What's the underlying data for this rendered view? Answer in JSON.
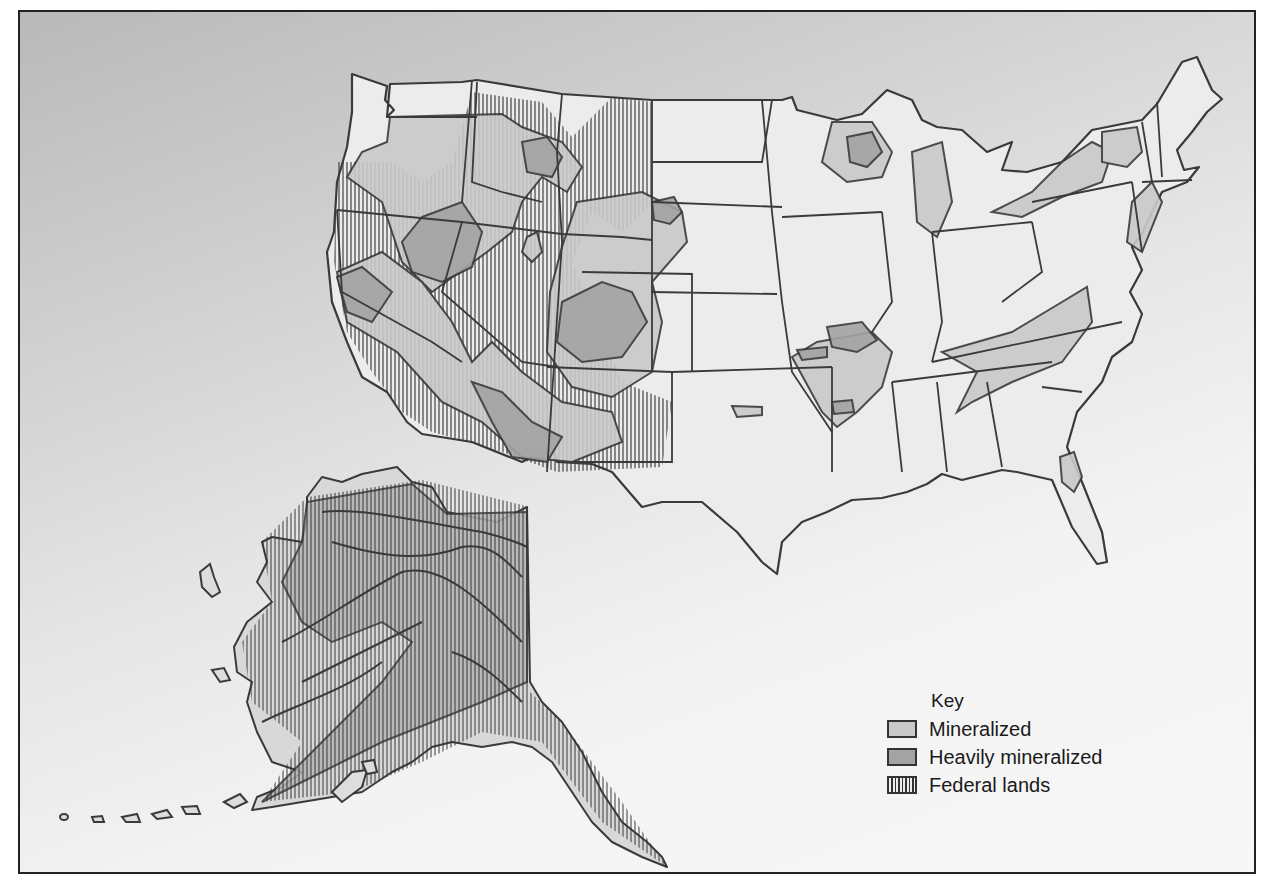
{
  "figure": {
    "type": "map"
  },
  "legend": {
    "title": "Key",
    "items": [
      {
        "label": "Mineralized",
        "pattern": "light-gray-fill",
        "color": "#c9c9c9"
      },
      {
        "label": "Heavily mineralized",
        "pattern": "dark-gray-fill",
        "color": "#a3a3a3"
      },
      {
        "label": "Federal lands",
        "pattern": "vertical-hatch",
        "color": "#333333"
      }
    ]
  },
  "colors": {
    "land": "#ececec",
    "outline": "#3a3a3a",
    "mineralized": "#c9c9c9",
    "heavily_mineralized": "#a3a3a3",
    "hatch": "#333333"
  },
  "regions": [
    "Contiguous United States",
    "Alaska"
  ]
}
